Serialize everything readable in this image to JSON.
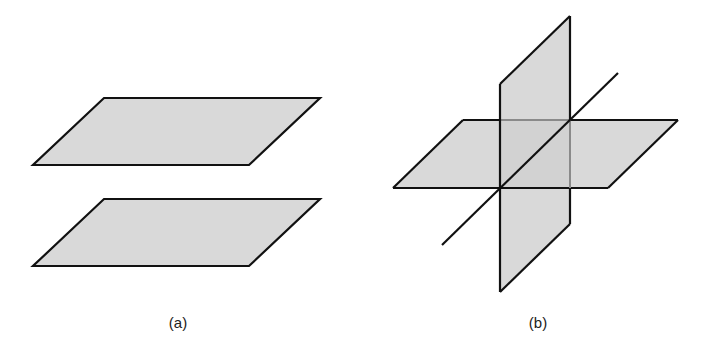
{
  "figures": [
    {
      "id": "a",
      "label": "(a)",
      "description": "Two parallel planes",
      "planes": [
        {
          "name": "upper-plane",
          "points": [
            [
              104,
              98
            ],
            [
              320,
              98
            ],
            [
              249,
              165
            ],
            [
              33,
              165
            ]
          ]
        },
        {
          "name": "lower-plane",
          "points": [
            [
              104,
              199
            ],
            [
              320,
              199
            ],
            [
              249,
              266
            ],
            [
              33,
              266
            ]
          ]
        }
      ]
    },
    {
      "id": "b",
      "label": "(b)",
      "description": "Two intersecting planes with a line",
      "planes": [
        {
          "name": "horizontal-plane",
          "points": [
            [
              463,
              120
            ],
            [
              678,
              120
            ],
            [
              608,
              188
            ],
            [
              393,
              188
            ]
          ]
        },
        {
          "name": "vertical-plane",
          "points": [
            [
              500,
              84
            ],
            [
              570,
              16
            ],
            [
              570,
              224
            ],
            [
              500,
              292
            ]
          ]
        }
      ],
      "line": {
        "from": [
          442,
          245
        ],
        "to": [
          618,
          73
        ]
      }
    }
  ],
  "colors": {
    "fill": "#d9d9d9",
    "stroke": "#111111",
    "hidden_stroke": "#8a8a8a",
    "label": "#222222"
  }
}
